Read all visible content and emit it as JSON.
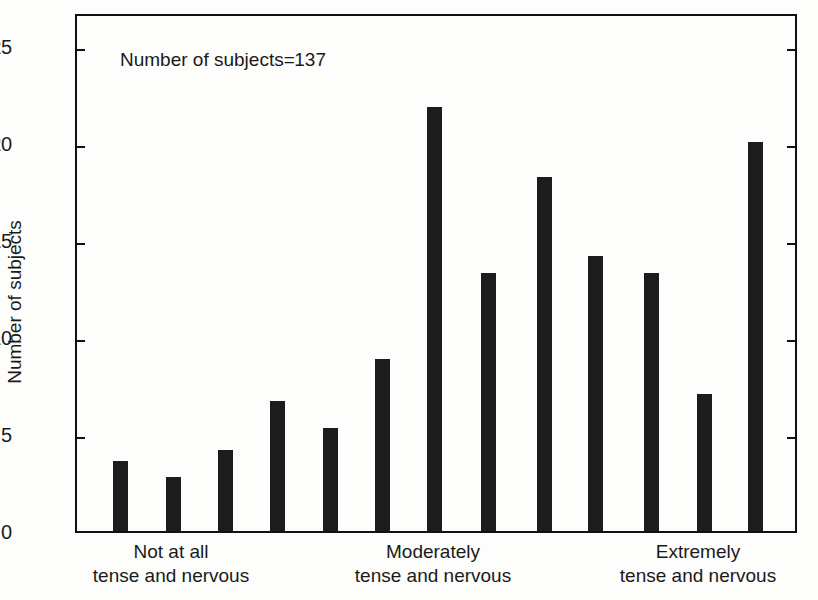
{
  "chart_data": {
    "type": "bar",
    "title": "",
    "subtitle": "",
    "xlabel": "",
    "ylabel": "Number of subjects",
    "ylim": [
      0,
      26.7
    ],
    "yticks": [
      0,
      5,
      10,
      15,
      20,
      25
    ],
    "ytick_labels": [
      "0",
      "5",
      "10",
      "15",
      "20",
      "25"
    ],
    "grid": false,
    "legend": null,
    "annotations": [
      {
        "text": "Number of subjects = 137",
        "label": "Number of subjects",
        "separator": "=",
        "value": "137",
        "position": "upper-left inside axes"
      }
    ],
    "bar_color": "#1c1c1c",
    "axis_color": "#111111",
    "background": "#fdfdfb",
    "n_categories": 13,
    "categories": [
      "1",
      "2",
      "3",
      "4",
      "5",
      "6",
      "7",
      "8",
      "9",
      "10",
      "11",
      "12",
      "13"
    ],
    "values": [
      3.6,
      2.8,
      4.2,
      6.7,
      5.3,
      8.9,
      21.9,
      13.3,
      18.3,
      14.2,
      13.3,
      7.1,
      20.1
    ],
    "x_group_labels": [
      {
        "line1": "Not at all",
        "line2": "tense and nervous",
        "anchor_category": "2"
      },
      {
        "line1": "Moderately",
        "line2": "tense and nervous",
        "anchor_category": "7"
      },
      {
        "line1": "Extremely",
        "line2": "tense and nervous",
        "anchor_category": "12"
      }
    ]
  },
  "axis": {
    "ytick_labels": [
      "25",
      "20",
      "15",
      "10",
      "5",
      "0"
    ],
    "ylabel": "Number of subjects"
  },
  "annotation": {
    "label": "Number of subjects",
    "separator": "=",
    "value": "137"
  },
  "xaxis": {
    "groups": [
      {
        "line1": "Not at all",
        "line2": "tense and nervous"
      },
      {
        "line1": "Moderately",
        "line2": "tense and nervous"
      },
      {
        "line1": "Extremely",
        "line2": "tense and nervous"
      }
    ]
  }
}
